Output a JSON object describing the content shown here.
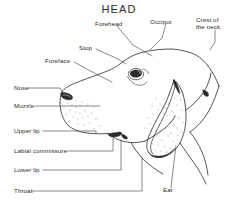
{
  "figure": {
    "title": "HEAD",
    "ink_color": "#2b2b2b",
    "background_color": "#ffffff"
  },
  "labels": {
    "forehead": "Forehead",
    "occiput": "Occiput",
    "crest_of_the_neck": "Crest of\nthe neck",
    "stop": "Stop",
    "foreface": "Foreface",
    "nose": "Nose",
    "muzzle": "Muzzle",
    "upper_lip": "Upper lip",
    "labial_commissure": "Labial commissure",
    "lower_lip": "Lower lip",
    "throat": "Throat",
    "ear": "Ear"
  }
}
